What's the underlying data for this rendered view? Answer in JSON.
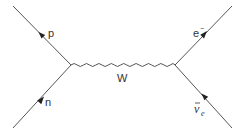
{
  "diagram": {
    "type": "feynman",
    "process": "beta decay",
    "line_color": "#555555",
    "label_color": "#333333",
    "vertices": [
      {
        "id": "v1",
        "x": 71,
        "y": 65
      },
      {
        "id": "v2",
        "x": 175,
        "y": 65
      }
    ],
    "particles": [
      {
        "id": "p",
        "label": "p",
        "kind": "fermion",
        "from": [
          13,
          6
        ],
        "to": [
          71,
          65
        ],
        "arrow": "toward-start"
      },
      {
        "id": "n",
        "label": "n",
        "kind": "fermion",
        "from": [
          13,
          128
        ],
        "to": [
          71,
          65
        ],
        "arrow": "toward-vertex"
      },
      {
        "id": "e",
        "label": "e",
        "superscript": "−",
        "kind": "fermion",
        "from": [
          175,
          65
        ],
        "to": [
          232,
          6
        ],
        "arrow": "away-from-vertex"
      },
      {
        "id": "nubar",
        "label": "ν",
        "overbar": true,
        "subscript": "e",
        "kind": "fermion",
        "from": [
          232,
          128
        ],
        "to": [
          175,
          65
        ],
        "arrow": "toward-vertex"
      }
    ],
    "boson": {
      "label": "W",
      "kind": "wavy",
      "from": [
        71,
        65
      ],
      "to": [
        175,
        65
      ]
    }
  }
}
